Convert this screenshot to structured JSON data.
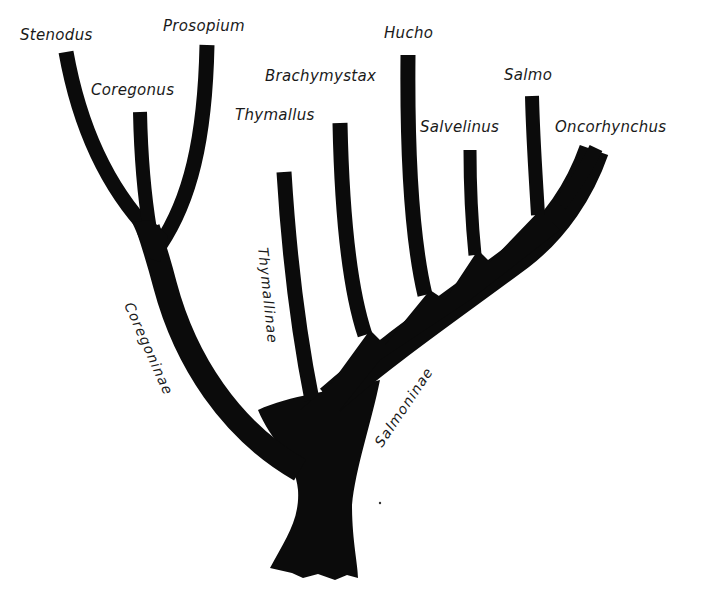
{
  "diagram": {
    "type": "phylogenetic-tree",
    "family_colors": {
      "ink": "#0b0b0b",
      "background": "#ffffff"
    },
    "genera": [
      {
        "id": "stenodus",
        "label": "Stenodus",
        "subfamily": "Coregoninae"
      },
      {
        "id": "coregonus",
        "label": "Coregonus",
        "subfamily": "Coregoninae"
      },
      {
        "id": "prosopium",
        "label": "Prosopium",
        "subfamily": "Coregoninae"
      },
      {
        "id": "thymallus",
        "label": "Thymallus",
        "subfamily": "Thymallinae"
      },
      {
        "id": "brachymystax",
        "label": "Brachymystax",
        "subfamily": "Salmoninae"
      },
      {
        "id": "hucho",
        "label": "Hucho",
        "subfamily": "Salmoninae"
      },
      {
        "id": "salvelinus",
        "label": "Salvelinus",
        "subfamily": "Salmoninae"
      },
      {
        "id": "salmo",
        "label": "Salmo",
        "subfamily": "Salmoninae"
      },
      {
        "id": "oncorhynchus",
        "label": "Oncorhynchus",
        "subfamily": "Salmoninae"
      }
    ],
    "subfamilies": [
      {
        "id": "coregoninae",
        "label": "Coregoninae"
      },
      {
        "id": "thymallinae",
        "label": "Thymallinae"
      },
      {
        "id": "salmoninae",
        "label": "Salmoninae"
      }
    ]
  }
}
